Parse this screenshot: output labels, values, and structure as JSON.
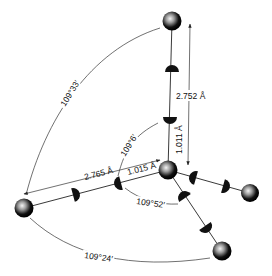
{
  "diagram": {
    "distances": {
      "o_o_vertical": "2.752 Å",
      "o_h_vertical": "1.011 Å",
      "o_o_left": "2.765 Å",
      "o_h_left": "1.015 Å"
    },
    "angles": {
      "top_left_arc": "109°33′",
      "inner_upper": "109°6′",
      "inner_lower": "109°52′",
      "bottom_arc": "109°24′"
    },
    "atoms": [
      "top",
      "center",
      "left",
      "right",
      "bottom"
    ],
    "colors": {
      "atom": "#111111",
      "atom_highlight": "#e8e8e8",
      "line": "#222222",
      "background": "#ffffff"
    }
  }
}
